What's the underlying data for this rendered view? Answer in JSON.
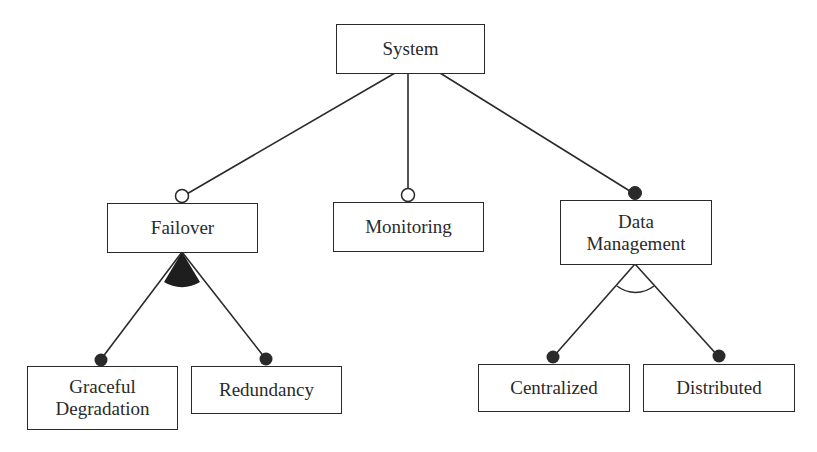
{
  "diagram": {
    "type": "feature-model",
    "nodes": {
      "system": {
        "label": "System"
      },
      "failover": {
        "label": "Failover"
      },
      "monitoring": {
        "label": "Monitoring"
      },
      "data_management": {
        "line1": "Data",
        "line2": "Management"
      },
      "graceful_degradation": {
        "line1": "Graceful",
        "line2": "Degradation"
      },
      "redundancy": {
        "label": "Redundancy"
      },
      "centralized": {
        "label": "Centralized"
      },
      "distributed": {
        "label": "Distributed"
      }
    },
    "edges": [
      {
        "from": "System",
        "to": "Failover",
        "kind": "optional"
      },
      {
        "from": "System",
        "to": "Monitoring",
        "kind": "optional"
      },
      {
        "from": "System",
        "to": "Data Management",
        "kind": "mandatory"
      },
      {
        "from": "Failover",
        "to": "Graceful Degradation",
        "kind": "mandatory",
        "group": "or"
      },
      {
        "from": "Failover",
        "to": "Redundancy",
        "kind": "mandatory",
        "group": "or"
      },
      {
        "from": "Data Management",
        "to": "Centralized",
        "kind": "mandatory",
        "group": "alternative"
      },
      {
        "from": "Data Management",
        "to": "Distributed",
        "kind": "mandatory",
        "group": "alternative"
      }
    ],
    "colors": {
      "stroke": "#2a2a2a",
      "filled": "#2a2a2a",
      "background": "#ffffff"
    }
  }
}
